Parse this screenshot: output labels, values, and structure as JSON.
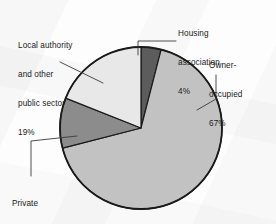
{
  "chart_data": {
    "type": "pie",
    "title": "",
    "subtitle": "",
    "xlabel": "",
    "ylabel": "",
    "grid": false,
    "legend_position": "none",
    "labels_position": "outside-with-leader-lines",
    "units": "percent",
    "total": 100,
    "start_angle_deg": 0,
    "direction": "clockwise",
    "categories": [
      "Housing association",
      "Owner-occupied",
      "Private rented",
      "Local authority and other public sector"
    ],
    "values": [
      4,
      67,
      10,
      19
    ],
    "slices": [
      {
        "name": "Housing association",
        "label_lines": [
          "Housing",
          "association",
          "4%"
        ],
        "value": 4,
        "value_text": "4%",
        "color": "#5c5c5c",
        "start_angle_deg": 0,
        "end_angle_deg": 14.4
      },
      {
        "name": "Owner-occupied",
        "label_lines": [
          "Owner-",
          "occupied",
          "67%"
        ],
        "value": 67,
        "value_text": "67%",
        "color": "#c2c2c2",
        "start_angle_deg": 14.4,
        "end_angle_deg": 255.6
      },
      {
        "name": "Private rented",
        "label_lines": [
          "Private",
          "rented",
          "10%"
        ],
        "value": 10,
        "value_text": "10%",
        "color": "#8c8c8c",
        "start_angle_deg": 255.6,
        "end_angle_deg": 291.6
      },
      {
        "name": "Local authority and other public sector",
        "label_lines": [
          "Local authority",
          "and other",
          "public sector",
          "19%"
        ],
        "value": 19,
        "value_text": "19%",
        "color": "#e8e8e8",
        "start_angle_deg": 291.6,
        "end_angle_deg": 360
      }
    ]
  },
  "labels": {
    "local_authority": {
      "line1": "Local authority",
      "line2": "and other",
      "line3": "public sector",
      "line4": "19%"
    },
    "housing_association": {
      "line1": "Housing",
      "line2": "association",
      "line3": "4%"
    },
    "owner_occupied": {
      "line1": "Owner-",
      "line2": "occupied",
      "line3": "67%"
    },
    "private_rented": {
      "line1": "Private",
      "line2": "rented",
      "line3": "10%"
    }
  },
  "colors": {
    "outline": "#1a1a1a",
    "leader_line": "#3a3a3a",
    "text": "#1a1a1a",
    "background": "#fdfdfd",
    "housing_association": "#5c5c5c",
    "owner_occupied": "#c2c2c2",
    "private_rented": "#8c8c8c",
    "local_authority": "#e8e8e8"
  }
}
